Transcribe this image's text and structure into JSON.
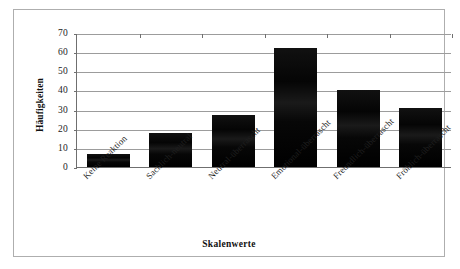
{
  "chart_data": {
    "type": "bar",
    "title": "",
    "xlabel": "Skalenwerte",
    "ylabel": "Häufigkeiten",
    "categories": [
      "Keine Reaktion",
      "Sachlich-neutral",
      "Neutral-überrascht",
      "Emotional-überrascht",
      "Freundlich-überrascht",
      "Fröhlich-überrascht"
    ],
    "values": [
      7,
      18,
      27,
      62,
      40,
      31
    ],
    "ylim": [
      0,
      70
    ],
    "ytick_labels": [
      "70",
      "60",
      "50",
      "40",
      "30",
      "20",
      "10",
      "0"
    ],
    "ytick_values": [
      70,
      60,
      50,
      40,
      30,
      20,
      10,
      0
    ],
    "ytick_step": 10,
    "grid": true,
    "legend": "none",
    "bar_color": "#0b0b0b",
    "gridline_color": "#9c9c9c",
    "axis_color": "#6f6f6f",
    "frame_color": "#aeaeae",
    "background_color": "#ffffff",
    "text_color": "#1b1b1b"
  }
}
